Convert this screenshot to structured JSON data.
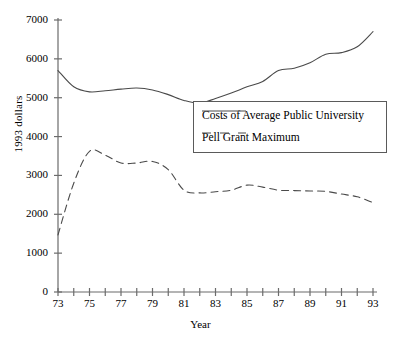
{
  "chart_data": {
    "type": "line",
    "title": "",
    "xlabel": "Year",
    "ylabel": "1993 dollars",
    "xlim": [
      73,
      93
    ],
    "ylim": [
      0,
      7000
    ],
    "ytick_values": [
      0,
      1000,
      2000,
      3000,
      4000,
      5000,
      6000,
      7000
    ],
    "ytick_labels": [
      "0",
      "1000",
      "2000",
      "3000",
      "4000",
      "5000",
      "6000",
      "7000"
    ],
    "xtick_values": [
      73,
      74,
      75,
      76,
      77,
      78,
      79,
      80,
      81,
      82,
      83,
      84,
      85,
      86,
      87,
      88,
      89,
      90,
      91,
      92,
      93
    ],
    "xtick_labels_shown": [
      "73",
      "75",
      "77",
      "79",
      "81",
      "83",
      "85",
      "87",
      "89",
      "91",
      "93"
    ],
    "grid": false,
    "legend_position": "center-right",
    "x": [
      73,
      74,
      75,
      76,
      77,
      78,
      79,
      80,
      81,
      82,
      83,
      84,
      85,
      86,
      87,
      88,
      89,
      90,
      91,
      92,
      93
    ],
    "series": [
      {
        "name": "Costs of Average Public University",
        "style": "solid",
        "color": "#4a4a4a",
        "values": [
          5700,
          5280,
          5150,
          5180,
          5220,
          5250,
          5200,
          5080,
          4930,
          4860,
          4980,
          5120,
          5280,
          5420,
          5700,
          5760,
          5900,
          6120,
          6160,
          6310,
          6700
        ]
      },
      {
        "name": "Pell Grant Maximum",
        "style": "dashed",
        "color": "#4a4a4a",
        "values": [
          1470,
          2800,
          3620,
          3520,
          3320,
          3320,
          3360,
          3150,
          2620,
          2550,
          2580,
          2620,
          2750,
          2700,
          2620,
          2610,
          2600,
          2590,
          2520,
          2450,
          2300
        ]
      }
    ]
  },
  "axes": {
    "ylabel": "1993 dollars",
    "xlabel": "Year"
  },
  "legend": {
    "entries": [
      {
        "label": "Costs of Average Public University"
      },
      {
        "label": "Pell Grant Maximum"
      }
    ]
  }
}
